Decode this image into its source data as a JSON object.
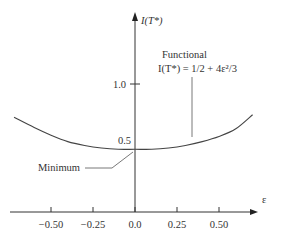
{
  "chart_data": {
    "type": "line",
    "title": "",
    "xlabel": "ε",
    "ylabel": "I(T*)",
    "xlim": [
      -0.75,
      0.85
    ],
    "ylim": [
      0,
      1.6
    ],
    "x_ticks": [
      -0.5,
      -0.25,
      0.0,
      0.25,
      0.5
    ],
    "x_tick_labels": [
      "−0.50",
      "−0.25",
      "0.0",
      "0.25",
      "0.50"
    ],
    "y_ticks": [
      0.5,
      1.0
    ],
    "y_tick_labels": [
      "0.5",
      "1.0"
    ],
    "grid": false,
    "legend": "none",
    "series": [
      {
        "name": "Functional",
        "x": [
          -0.72,
          -0.6,
          -0.5,
          -0.4,
          -0.3,
          -0.2,
          -0.1,
          0.0,
          0.1,
          0.2,
          0.3,
          0.4,
          0.5,
          0.6,
          0.7
        ],
        "y": [
          0.74,
          0.66,
          0.6,
          0.55,
          0.52,
          0.5,
          0.49,
          0.49,
          0.49,
          0.5,
          0.52,
          0.55,
          0.59,
          0.65,
          0.76
        ]
      }
    ],
    "annotations": [
      {
        "text_line1": "Functional",
        "text_line2": "I(T*) = 1/2 + 4ε²/3",
        "points_to": [
          0.27,
          0.57
        ]
      },
      {
        "text": "Minimum",
        "points_to": [
          0.0,
          0.49
        ]
      }
    ]
  }
}
